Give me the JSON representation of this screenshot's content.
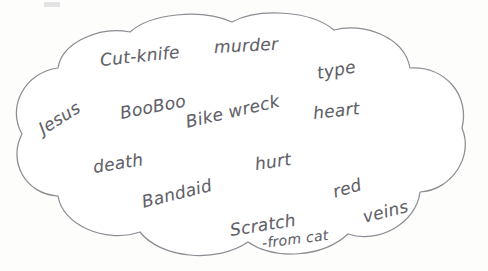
{
  "diagram": {
    "type": "word-cluster-cloud",
    "title": "",
    "shape": "hand-drawn cloud / thought bubble",
    "outline_color": "#8c8c93",
    "ink_color": "#55555c",
    "background_color": "#fdfdfc",
    "words": [
      {
        "text": "Cut-knife",
        "x": 100,
        "y": 50,
        "rotate": -6,
        "size": 17
      },
      {
        "text": "murder",
        "x": 214,
        "y": 37,
        "rotate": -3,
        "size": 17
      },
      {
        "text": "type",
        "x": 317,
        "y": 63,
        "rotate": -10,
        "size": 17
      },
      {
        "text": "Jesus",
        "x": 40,
        "y": 120,
        "rotate": -32,
        "size": 17
      },
      {
        "text": "BooBoo",
        "x": 120,
        "y": 103,
        "rotate": -11,
        "size": 17
      },
      {
        "text": "Bike wreck",
        "x": 186,
        "y": 112,
        "rotate": -13,
        "size": 17
      },
      {
        "text": "heart",
        "x": 313,
        "y": 103,
        "rotate": -6,
        "size": 17
      },
      {
        "text": "death",
        "x": 93,
        "y": 157,
        "rotate": -9,
        "size": 17
      },
      {
        "text": "Bandaid",
        "x": 142,
        "y": 192,
        "rotate": -14,
        "size": 17
      },
      {
        "text": "hurt",
        "x": 255,
        "y": 154,
        "rotate": -8,
        "size": 17
      },
      {
        "text": "red",
        "x": 333,
        "y": 182,
        "rotate": -16,
        "size": 17
      },
      {
        "text": "Scratch",
        "x": 230,
        "y": 220,
        "rotate": -9,
        "size": 17
      },
      {
        "text": "-from cat",
        "x": 262,
        "y": 235,
        "rotate": -7,
        "size": 14
      },
      {
        "text": "veins",
        "x": 363,
        "y": 207,
        "rotate": -14,
        "size": 17
      }
    ]
  }
}
